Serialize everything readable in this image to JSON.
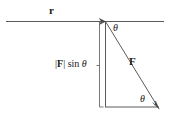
{
  "figure": {
    "background_color": "#ffffff",
    "stroke_color": "#4d4d4d",
    "text_color": "#1a1a1a",
    "width": 169,
    "height": 117
  },
  "labels": {
    "r_vector": "r",
    "F_vector": "F",
    "theta_top": "θ",
    "theta_bottom": "θ",
    "f_sin_open_bar": "|",
    "f_sin_F": "F",
    "f_sin_close_bar": "|",
    "f_sin_function": " sin ",
    "f_sin_theta": "θ"
  },
  "geometry": {
    "vertex": {
      "x": 105,
      "y": 21
    },
    "r_line_start": {
      "x": 6,
      "y": 21
    },
    "r_line_end": {
      "x": 164,
      "y": 21
    },
    "r_arrow_tip": {
      "x": 105,
      "y": 21
    },
    "F_arrow_tip": {
      "x": 158,
      "y": 107
    },
    "triangle_vertical_bottom": {
      "x": 105,
      "y": 107
    },
    "triangle_bottom_right": {
      "x": 158,
      "y": 107
    },
    "measure_bracket_x": 99,
    "measure_bracket_top_y": 22,
    "measure_bracket_bottom_y": 107
  }
}
